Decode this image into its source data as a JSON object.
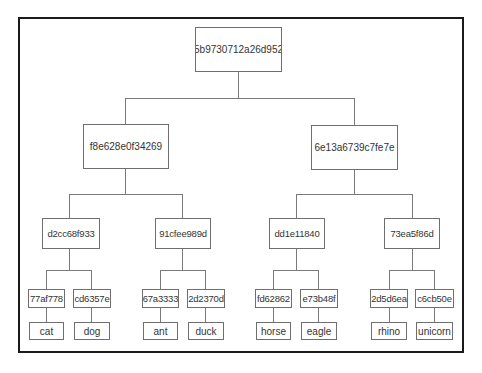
{
  "diagram": {
    "type": "merkle-tree",
    "root": {
      "label": "5b9730712a26d952"
    },
    "level1": [
      {
        "label": "f8e628e0f34269"
      },
      {
        "label": "6e13a6739c7fe7e"
      }
    ],
    "level2": [
      {
        "label": "d2cc68f933"
      },
      {
        "label": "91cfee989d"
      },
      {
        "label": "dd1e11840"
      },
      {
        "label": "73ea5f86d"
      }
    ],
    "leaf_hashes": [
      {
        "label": "77af778"
      },
      {
        "label": "cd6357e"
      },
      {
        "label": "67a3333"
      },
      {
        "label": "2d2370d"
      },
      {
        "label": "fd62862"
      },
      {
        "label": "e73b48f"
      },
      {
        "label": "2d5d6ea"
      },
      {
        "label": "c6cb50e"
      }
    ],
    "data_blocks": [
      {
        "label": "cat"
      },
      {
        "label": "dog"
      },
      {
        "label": "ant"
      },
      {
        "label": "duck"
      },
      {
        "label": "horse"
      },
      {
        "label": "eagle"
      },
      {
        "label": "rhino"
      },
      {
        "label": "unicorn"
      }
    ],
    "colors": {
      "frame_border": "#1a1a1a",
      "node_border": "#6f6f6f",
      "connector": "#7a7a7a",
      "text": "#333333",
      "background": "#ffffff"
    }
  }
}
